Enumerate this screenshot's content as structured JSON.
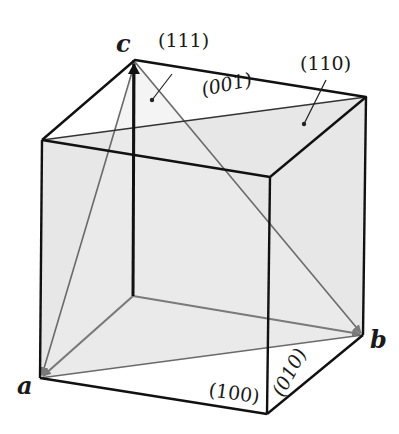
{
  "diagram": {
    "title": "",
    "vertex_labels": {
      "a": "a",
      "b": "b",
      "c": "c"
    },
    "plane_labels": {
      "p111": "(111)",
      "p110": "(110)",
      "p001": "(001)",
      "p100": "(100)",
      "p010": "(010)"
    },
    "colors": {
      "edge": "#111111",
      "hidden_edge": "#6e6e6e",
      "vector": "#7a7a7a",
      "plane_110_fill": "#e6e6e6",
      "plane_111_fill": "#efefef",
      "background": "#ffffff"
    }
  }
}
